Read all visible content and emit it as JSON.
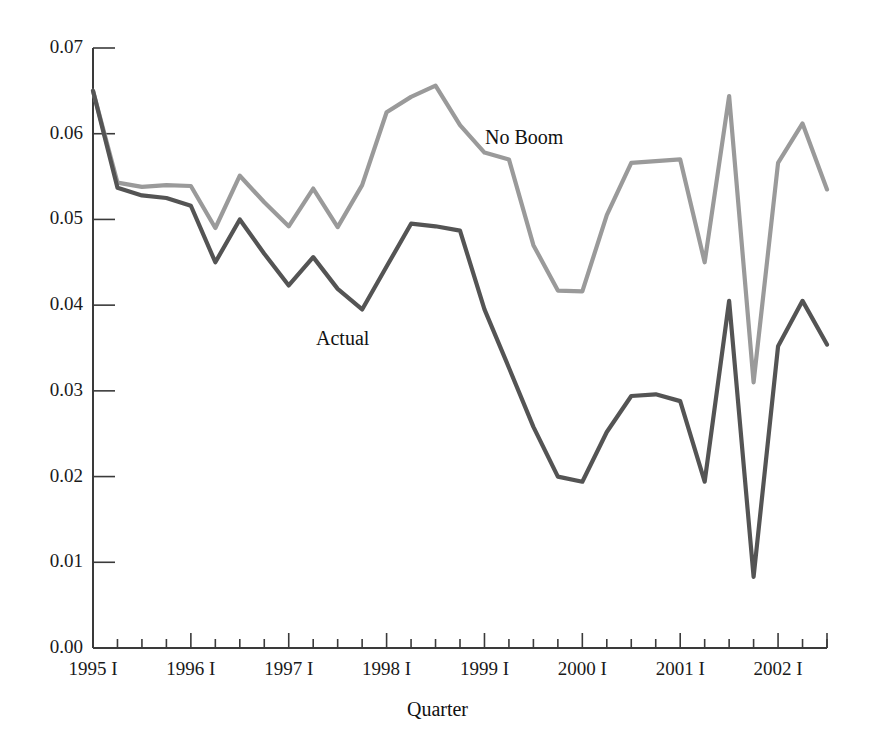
{
  "chart_data": {
    "type": "line",
    "title": "",
    "xlabel": "Quarter",
    "ylabel": "",
    "ylim": [
      0.0,
      0.07
    ],
    "grid": false,
    "legend_position": "inline-annotations",
    "y_ticks": [
      "0.00",
      "0.01",
      "0.02",
      "0.03",
      "0.04",
      "0.05",
      "0.06",
      "0.07"
    ],
    "y_tick_values": [
      0.0,
      0.01,
      0.02,
      0.03,
      0.04,
      0.05,
      0.06,
      0.07
    ],
    "x_tick_labels": [
      "1995 I",
      "1996 I",
      "1997 I",
      "1998 I",
      "1999 I",
      "2000 I",
      "2001 I",
      "2002 I"
    ],
    "x_major_tick_indices": [
      0,
      4,
      8,
      12,
      16,
      20,
      24,
      28
    ],
    "x": [
      "1995 I",
      "1995 II",
      "1995 III",
      "1995 IV",
      "1996 I",
      "1996 II",
      "1996 III",
      "1996 IV",
      "1997 I",
      "1997 II",
      "1997 III",
      "1997 IV",
      "1998 I",
      "1998 II",
      "1998 III",
      "1998 IV",
      "1999 I",
      "1999 II",
      "1999 III",
      "1999 IV",
      "2000 I",
      "2000 II",
      "2000 III",
      "2000 IV",
      "2001 I",
      "2001 II",
      "2001 III",
      "2001 IV",
      "2002 I",
      "2002 II",
      "2002 III"
    ],
    "series": [
      {
        "name": "No Boom",
        "color": "#9a9a9a",
        "label_text": "No Boom",
        "values": [
          0.065,
          0.0543,
          0.0538,
          0.054,
          0.0539,
          0.049,
          0.0551,
          0.052,
          0.0492,
          0.0536,
          0.0491,
          0.054,
          0.0625,
          0.0643,
          0.0656,
          0.061,
          0.0578,
          0.057,
          0.047,
          0.0417,
          0.0416,
          0.0505,
          0.0566,
          0.0568,
          0.057,
          0.045,
          0.0644,
          0.031,
          0.0566,
          0.0612,
          0.0535
        ]
      },
      {
        "name": "Actual",
        "color": "#545454",
        "label_text": "Actual",
        "values": [
          0.065,
          0.0537,
          0.0528,
          0.0525,
          0.0516,
          0.045,
          0.05,
          0.046,
          0.0423,
          0.0456,
          0.0419,
          0.0395,
          0.0445,
          0.0495,
          0.0492,
          0.0487,
          0.0395,
          0.0327,
          0.0258,
          0.02,
          0.0194,
          0.0252,
          0.0294,
          0.0296,
          0.0288,
          0.0194,
          0.0405,
          0.0083,
          0.0352,
          0.0405,
          0.0354
        ]
      }
    ],
    "annotations": [
      {
        "text": "No Boom",
        "x_px": 485,
        "y_px": 126
      },
      {
        "text": "Actual",
        "x_px": 316,
        "y_px": 327
      }
    ]
  },
  "axis": {
    "x_title": "Quarter"
  }
}
